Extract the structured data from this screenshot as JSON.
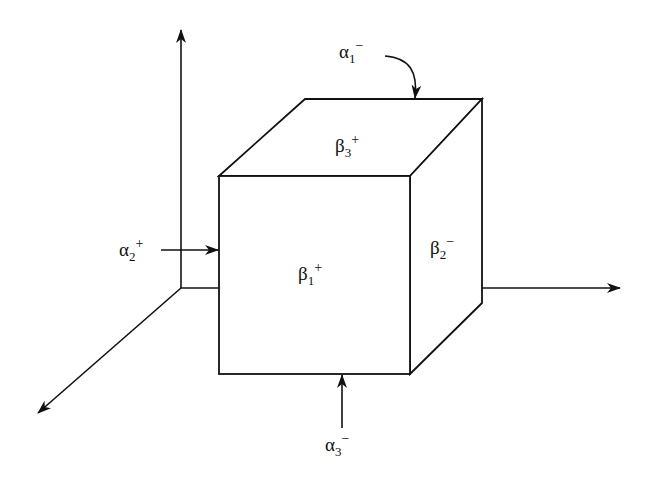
{
  "diagram": {
    "type": "3d-cube-with-axes",
    "stroke_color": "#111111",
    "background": "#ffffff",
    "faces": {
      "front": {
        "greek": "β",
        "sub": "1",
        "sup": "+"
      },
      "top": {
        "greek": "β",
        "sub": "3",
        "sup": "+"
      },
      "right": {
        "greek": "β",
        "sub": "2",
        "sup": "−"
      }
    },
    "arrows": {
      "top": {
        "greek": "α",
        "sub": "1",
        "sup": "−"
      },
      "left": {
        "greek": "α",
        "sub": "2",
        "sup": "+"
      },
      "bottom": {
        "greek": "α",
        "sub": "3",
        "sup": "−"
      }
    },
    "axes": [
      "vertical-up",
      "horizontal-right",
      "diagonal-out"
    ]
  }
}
